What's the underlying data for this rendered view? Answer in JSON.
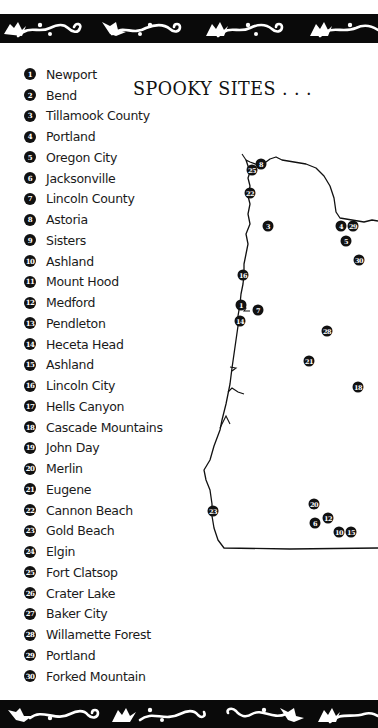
{
  "title": "SPOOKY SITES . . .",
  "colors": {
    "banner": "#0a0a0a",
    "ornament": "#ffffff",
    "marker": "#111111",
    "text": "#1a1a1a"
  },
  "legend": [
    {
      "num": "1",
      "label": "Newport"
    },
    {
      "num": "2",
      "label": "Bend"
    },
    {
      "num": "3",
      "label": "Tillamook County"
    },
    {
      "num": "4",
      "label": "Portland"
    },
    {
      "num": "5",
      "label": "Oregon City"
    },
    {
      "num": "6",
      "label": "Jacksonville"
    },
    {
      "num": "7",
      "label": "Lincoln County"
    },
    {
      "num": "8",
      "label": "Astoria"
    },
    {
      "num": "9",
      "label": "Sisters"
    },
    {
      "num": "10",
      "label": "Ashland"
    },
    {
      "num": "11",
      "label": "Mount Hood"
    },
    {
      "num": "12",
      "label": "Medford"
    },
    {
      "num": "13",
      "label": "Pendleton"
    },
    {
      "num": "14",
      "label": "Heceta Head"
    },
    {
      "num": "15",
      "label": "Ashland"
    },
    {
      "num": "16",
      "label": "Lincoln City"
    },
    {
      "num": "17",
      "label": "Hells Canyon"
    },
    {
      "num": "18",
      "label": "Cascade Mountains"
    },
    {
      "num": "19",
      "label": "John Day"
    },
    {
      "num": "20",
      "label": "Merlin"
    },
    {
      "num": "21",
      "label": "Eugene"
    },
    {
      "num": "22",
      "label": "Cannon Beach"
    },
    {
      "num": "23",
      "label": "Gold Beach"
    },
    {
      "num": "24",
      "label": "Elgin"
    },
    {
      "num": "25",
      "label": "Fort Clatsop"
    },
    {
      "num": "26",
      "label": "Crater Lake"
    },
    {
      "num": "27",
      "label": "Baker City"
    },
    {
      "num": "28",
      "label": "Willamette Forest"
    },
    {
      "num": "29",
      "label": "Portland"
    },
    {
      "num": "30",
      "label": "Forked Mountain"
    }
  ],
  "map_markers": [
    {
      "num": "8",
      "x": 261,
      "y": 164
    },
    {
      "num": "25",
      "x": 252,
      "y": 170
    },
    {
      "num": "22",
      "x": 250,
      "y": 193
    },
    {
      "num": "3",
      "x": 268,
      "y": 226
    },
    {
      "num": "4",
      "x": 341,
      "y": 226
    },
    {
      "num": "29",
      "x": 353,
      "y": 226
    },
    {
      "num": "5",
      "x": 346,
      "y": 241
    },
    {
      "num": "30",
      "x": 359,
      "y": 260
    },
    {
      "num": "16",
      "x": 243,
      "y": 275
    },
    {
      "num": "1",
      "x": 241,
      "y": 305
    },
    {
      "num": "7",
      "x": 258,
      "y": 310
    },
    {
      "num": "14",
      "x": 240,
      "y": 321
    },
    {
      "num": "28",
      "x": 327,
      "y": 331
    },
    {
      "num": "21",
      "x": 309,
      "y": 361
    },
    {
      "num": "18",
      "x": 358,
      "y": 387
    },
    {
      "num": "20",
      "x": 314,
      "y": 504
    },
    {
      "num": "23",
      "x": 213,
      "y": 511
    },
    {
      "num": "12",
      "x": 328,
      "y": 518
    },
    {
      "num": "6",
      "x": 315,
      "y": 523
    },
    {
      "num": "10",
      "x": 339,
      "y": 532
    },
    {
      "num": "15",
      "x": 351,
      "y": 532
    }
  ]
}
